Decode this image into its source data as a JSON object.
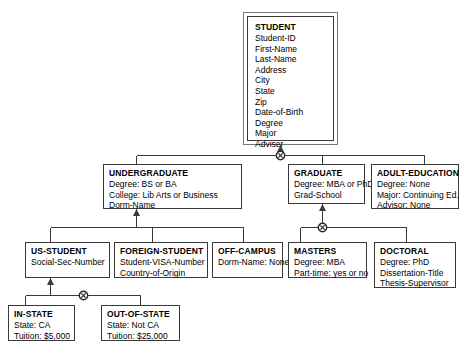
{
  "diagram": {
    "type": "eer-generalization-hierarchy",
    "specialization_symbol": "circle-with-x",
    "entities": [
      {
        "id": "student",
        "name": "STUDENT",
        "role": "superclass",
        "attributes": [
          "Student-ID",
          "First-Name",
          "Last-Name",
          "Address",
          "City",
          "State",
          "Zip",
          "Date-of-Birth",
          "Degree",
          "Major",
          "Adviser"
        ]
      },
      {
        "id": "undergraduate",
        "name": "UNDERGRADUATE",
        "role": "subclass",
        "attributes": [
          "Degree: BS or BA",
          "College: Lib Arts or Business",
          "Dorm-Name"
        ]
      },
      {
        "id": "graduate",
        "name": "GRADUATE",
        "role": "subclass",
        "attributes": [
          "Degree: MBA or PhD",
          "Grad-School"
        ]
      },
      {
        "id": "adult-education",
        "name": "ADULT-EDUCATION",
        "role": "subclass",
        "attributes": [
          "Degree: None",
          "Major: Continuing Ed.",
          "Advisor: None"
        ]
      },
      {
        "id": "us-student",
        "name": "US-STUDENT",
        "role": "subclass",
        "attributes": [
          "Social-Sec-Number"
        ]
      },
      {
        "id": "foreign-student",
        "name": "FOREIGN-STUDENT",
        "role": "subclass",
        "attributes": [
          "Student-VISA-Number",
          "Country-of-Origin"
        ]
      },
      {
        "id": "off-campus",
        "name": "OFF-CAMPUS",
        "role": "subclass",
        "attributes": [
          "Dorm-Name: None"
        ]
      },
      {
        "id": "masters",
        "name": "MASTERS",
        "role": "subclass",
        "attributes": [
          "Degree: MBA",
          "Part-time: yes or no"
        ]
      },
      {
        "id": "doctoral",
        "name": "DOCTORAL",
        "role": "subclass",
        "attributes": [
          "Degree: PhD",
          "Dissertation-Title",
          "Thesis-Supervisor"
        ]
      },
      {
        "id": "in-state",
        "name": "IN-STATE",
        "role": "subclass",
        "attributes": [
          "State: CA",
          "Tuition: $5,000"
        ]
      },
      {
        "id": "out-of-state",
        "name": "OUT-OF-STATE",
        "role": "subclass",
        "attributes": [
          "State: Not CA",
          "Tuition: $25,000"
        ]
      }
    ]
  },
  "colors": {
    "line": "#3a3a3a",
    "box_border": "#3a3a3a",
    "superclass_outer_border": "#777777",
    "text": "#000000",
    "background": "#ffffff"
  }
}
